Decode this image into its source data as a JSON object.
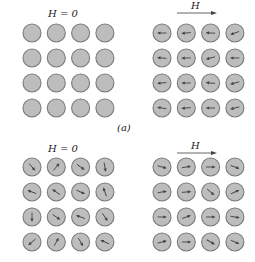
{
  "figure": {
    "caption_a": "(a)",
    "panels": [
      {
        "id": "top-left",
        "label": "H = 0",
        "field": "none",
        "origin": {
          "x": 32,
          "y": 33
        },
        "spacing": {
          "dx": 24.3,
          "dy": 25
        },
        "radius": 9,
        "show_arrows": false,
        "angles": []
      },
      {
        "id": "top-right",
        "label": "H",
        "field": "arrow-right",
        "origin": {
          "x": 162,
          "y": 33
        },
        "spacing": {
          "dx": 24.3,
          "dy": 25
        },
        "radius": 9,
        "show_arrows": true,
        "angles": [
          [
            180,
            185,
            178,
            200
          ],
          [
            175,
            182,
            195,
            180
          ],
          [
            185,
            180,
            175,
            195
          ],
          [
            170,
            185,
            180,
            195
          ]
        ]
      },
      {
        "id": "bottom-left",
        "label": "H = 0",
        "field": "none",
        "origin": {
          "x": 32,
          "y": 167
        },
        "spacing": {
          "dx": 24.3,
          "dy": 25
        },
        "radius": 9,
        "show_arrows": true,
        "angles": [
          [
            -50,
            50,
            -35,
            -80
          ],
          [
            160,
            145,
            -25,
            110
          ],
          [
            -90,
            -35,
            160,
            -55
          ],
          [
            -140,
            60,
            -60,
            155
          ]
        ]
      },
      {
        "id": "bottom-right",
        "label": "H",
        "field": "arrow-right",
        "origin": {
          "x": 162,
          "y": 167
        },
        "spacing": {
          "dx": 24.3,
          "dy": 25
        },
        "radius": 9,
        "show_arrows": true,
        "angles": [
          [
            -15,
            10,
            0,
            -20
          ],
          [
            10,
            5,
            -40,
            25
          ],
          [
            0,
            20,
            0,
            -10
          ],
          [
            15,
            0,
            -30,
            -25
          ]
        ]
      }
    ],
    "colors": {
      "circle_fill": "#bdbdbd",
      "circle_stroke": "#7a7a7a",
      "arrow": "#444444",
      "background": "#ffffff"
    }
  }
}
